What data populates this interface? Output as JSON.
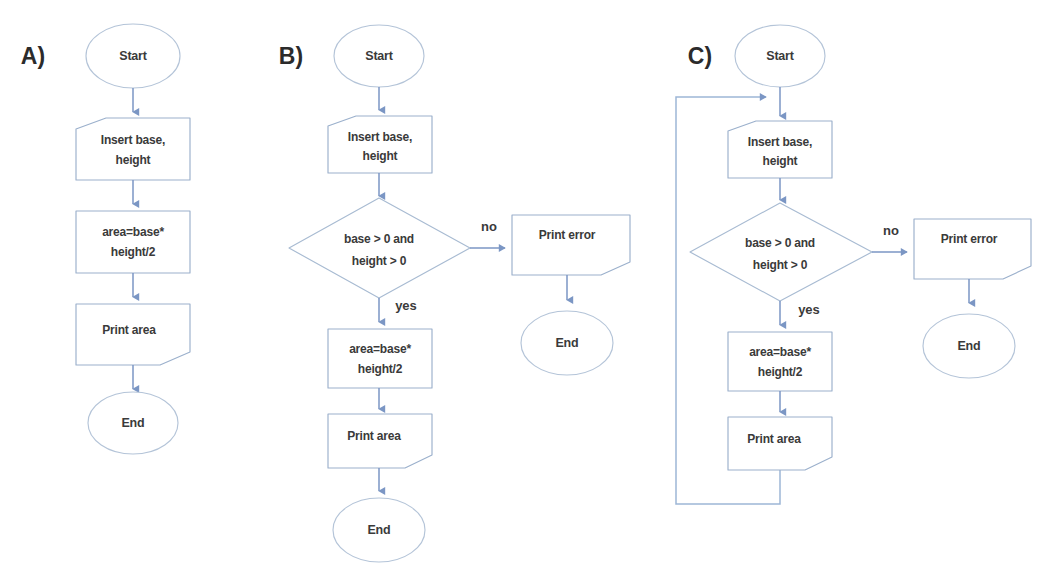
{
  "figure": {
    "background_color": "#ffffff",
    "shape_stroke_color": "#9bb0cc",
    "connector_color": "#7b96c4",
    "text_color": "#3a3a3a",
    "width": 1043,
    "height": 581
  },
  "panels": [
    {
      "id": "a",
      "label": "A)",
      "nodes": {
        "start": "Start",
        "input_line1": "Insert base,",
        "input_line2": "height",
        "process_line1": "area=base*",
        "process_line2": "height/2",
        "output": "Print area",
        "end": "End"
      }
    },
    {
      "id": "b",
      "label": "B)",
      "nodes": {
        "start": "Start",
        "input_line1": "Insert base,",
        "input_line2": "height",
        "decision_line1": "base > 0 and",
        "decision_line2": "height > 0",
        "process_line1": "area=base*",
        "process_line2": "height/2",
        "output": "Print area",
        "end": "End",
        "error_output": "Print error",
        "error_end": "End"
      },
      "edge_labels": {
        "no": "no",
        "yes": "yes"
      }
    },
    {
      "id": "c",
      "label": "C)",
      "nodes": {
        "start": "Start",
        "input_line1": "Insert base,",
        "input_line2": "height",
        "decision_line1": "base > 0 and",
        "decision_line2": "height > 0",
        "process_line1": "area=base*",
        "process_line2": "height/2",
        "output": "Print area",
        "error_output": "Print error",
        "error_end": "End"
      },
      "edge_labels": {
        "no": "no",
        "yes": "yes"
      }
    }
  ]
}
